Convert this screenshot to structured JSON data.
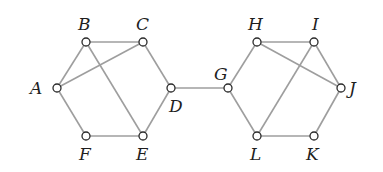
{
  "diagram": {
    "type": "graph",
    "nodes": [
      {
        "id": "A",
        "x": 57,
        "y": 88,
        "label": "A",
        "lx": 30,
        "ly": 94,
        "anchor": "start"
      },
      {
        "id": "B",
        "x": 86,
        "y": 42,
        "label": "B",
        "lx": 78,
        "ly": 30,
        "anchor": "start"
      },
      {
        "id": "C",
        "x": 143,
        "y": 42,
        "label": "C",
        "lx": 136,
        "ly": 30,
        "anchor": "start"
      },
      {
        "id": "D",
        "x": 171,
        "y": 88,
        "label": "D",
        "lx": 169,
        "ly": 112,
        "anchor": "start"
      },
      {
        "id": "E",
        "x": 143,
        "y": 136,
        "label": "E",
        "lx": 136,
        "ly": 160,
        "anchor": "start"
      },
      {
        "id": "F",
        "x": 86,
        "y": 136,
        "label": "F",
        "lx": 79,
        "ly": 160,
        "anchor": "start"
      },
      {
        "id": "G",
        "x": 228,
        "y": 88,
        "label": "G",
        "lx": 214,
        "ly": 80,
        "anchor": "start"
      },
      {
        "id": "H",
        "x": 257,
        "y": 42,
        "label": "H",
        "lx": 248,
        "ly": 30,
        "anchor": "start"
      },
      {
        "id": "I",
        "x": 314,
        "y": 42,
        "label": "I",
        "lx": 312,
        "ly": 30,
        "anchor": "start"
      },
      {
        "id": "J",
        "x": 341,
        "y": 88,
        "label": "J",
        "lx": 349,
        "ly": 94,
        "anchor": "start"
      },
      {
        "id": "K",
        "x": 314,
        "y": 136,
        "label": "K",
        "lx": 306,
        "ly": 160,
        "anchor": "start"
      },
      {
        "id": "L",
        "x": 257,
        "y": 136,
        "label": "L",
        "lx": 250,
        "ly": 160,
        "anchor": "start"
      }
    ],
    "edges": [
      [
        "A",
        "B"
      ],
      [
        "B",
        "C"
      ],
      [
        "C",
        "D"
      ],
      [
        "D",
        "E"
      ],
      [
        "E",
        "F"
      ],
      [
        "F",
        "A"
      ],
      [
        "A",
        "C"
      ],
      [
        "B",
        "E"
      ],
      [
        "D",
        "G"
      ],
      [
        "G",
        "H"
      ],
      [
        "H",
        "I"
      ],
      [
        "I",
        "J"
      ],
      [
        "J",
        "K"
      ],
      [
        "K",
        "L"
      ],
      [
        "L",
        "G"
      ],
      [
        "H",
        "J"
      ],
      [
        "I",
        "L"
      ]
    ],
    "colors": {
      "edge": "#9e9e9e",
      "node_stroke": "#2a2a2a",
      "node_fill": "#ffffff",
      "label": "#1e1e1e",
      "background": "#ffffff"
    },
    "node_radius": 4
  }
}
